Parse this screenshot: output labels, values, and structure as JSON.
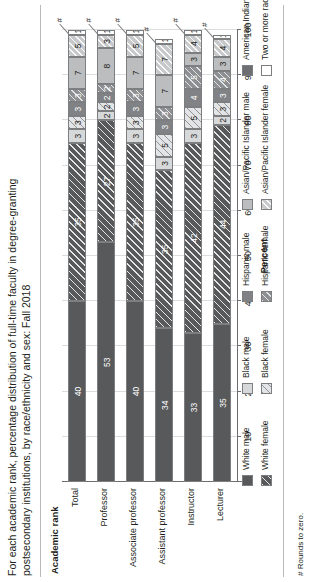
{
  "figure": {
    "title": "For each academic rank, percentage distribution of full-time faculty in degree-granting postsecondary institutions, by race/ethnicity and sex: Fall 2018",
    "footnote": "# Rounds to zero.",
    "y_axis_label": "Academic rank",
    "x_axis_label": "Percent",
    "rounds_to_zero_symbol": "#"
  },
  "chart_data": {
    "type": "bar",
    "orientation": "horizontal-stacked",
    "title": "For each academic rank, percentage distribution of full-time faculty in degree-granting postsecondary institutions, by race/ethnicity and sex: Fall 2018",
    "xlabel": "Percent",
    "ylabel": "Academic rank",
    "xlim": [
      0,
      100
    ],
    "xticks": [
      0,
      10,
      20,
      30,
      40,
      50,
      60,
      70,
      80,
      90,
      100
    ],
    "grid": true,
    "legend_position": "bottom",
    "categories": [
      "Total",
      "Professor",
      "Associate professor",
      "Assistant professor",
      "Instructor",
      "Lecturer"
    ],
    "series": [
      {
        "name": "White male",
        "color": "#58595b",
        "pattern": "solid",
        "values": [
          40,
          53,
          40,
          34,
          33,
          35
        ],
        "labels": [
          "40",
          "53",
          "40",
          "34",
          "33",
          "35"
        ]
      },
      {
        "name": "White female",
        "color": "#58595b",
        "pattern": "hatch",
        "values": [
          35,
          27,
          35,
          35,
          42,
          44
        ],
        "labels": [
          "35",
          "27",
          "35",
          "35",
          "42",
          "44"
        ]
      },
      {
        "name": "Black male",
        "color": "#d7d8da",
        "pattern": "solid",
        "values": [
          3,
          2,
          3,
          3,
          3,
          2
        ],
        "labels": [
          "3",
          "2",
          "3",
          "3",
          "3",
          "2"
        ]
      },
      {
        "name": "Black female",
        "color": "#e3e4e6",
        "pattern": "hatch",
        "values": [
          3,
          2,
          3,
          5,
          5,
          3
        ],
        "labels": [
          "3",
          "2",
          "3",
          "5",
          "5",
          "3"
        ]
      },
      {
        "name": "Hispanic male",
        "color": "#808285",
        "pattern": "solid",
        "values": [
          3,
          2,
          3,
          3,
          4,
          3
        ],
        "labels": [
          "3",
          "2",
          "3",
          "3",
          "4",
          "3"
        ]
      },
      {
        "name": "Hispanic female",
        "color": "#8d8f92",
        "pattern": "hatch",
        "values": [
          3,
          2,
          3,
          3,
          5,
          4
        ],
        "labels": [
          "3",
          "2",
          "3",
          "3",
          "5",
          "4"
        ]
      },
      {
        "name": "Asian/Pacific Islander male",
        "color": "#bbbdbf",
        "pattern": "solid",
        "values": [
          7,
          8,
          7,
          7,
          3,
          3
        ],
        "labels": [
          "7",
          "8",
          "7",
          "7",
          "3",
          "3"
        ]
      },
      {
        "name": "Asian/Pacific Islander female",
        "color": "#c7c9cb",
        "pattern": "hatch",
        "values": [
          5,
          3,
          5,
          7,
          4,
          4
        ],
        "labels": [
          "5",
          "3",
          "5",
          "7",
          "4",
          "4"
        ]
      },
      {
        "name": "American Indian/Alaska Native",
        "color": "#6d6e71",
        "pattern": "solid",
        "values": [
          0,
          0,
          0,
          0,
          0,
          0
        ],
        "labels": [
          "#",
          "#",
          "#",
          "#",
          "#",
          "#"
        ]
      },
      {
        "name": "Two or more races",
        "color": "#ffffff",
        "pattern": "solid",
        "values": [
          1,
          1,
          1,
          1,
          1,
          1
        ],
        "labels": [
          "1",
          "1",
          "1",
          "1",
          "1",
          "1"
        ]
      }
    ]
  },
  "legend": {
    "columns": [
      {
        "items": [
          {
            "label": "White male",
            "series": 0
          },
          {
            "label": "White female",
            "series": 1
          }
        ]
      },
      {
        "items": [
          {
            "label": "Black male",
            "series": 2
          },
          {
            "label": "Black female",
            "series": 3
          }
        ]
      },
      {
        "items": [
          {
            "label": "Hispanic male",
            "series": 4
          },
          {
            "label": "Hispanic female",
            "series": 5
          }
        ]
      },
      {
        "items": [
          {
            "label": "Asian/Pacific Islander male",
            "series": 6
          },
          {
            "label": "Asian/Pacific Islander female",
            "series": 7
          }
        ]
      },
      {
        "items": [
          {
            "label": "American Indian/Alaska Native",
            "series": 8
          },
          {
            "label": "Two or more races",
            "series": 9
          }
        ]
      }
    ]
  }
}
